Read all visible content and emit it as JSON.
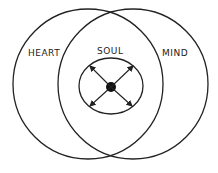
{
  "diagram": {
    "labels": {
      "left": "HEART",
      "center": "SOUL",
      "right": "MIND"
    },
    "colors": {
      "stroke": "#222222",
      "background": "#ffffff"
    },
    "elements": {
      "left_circle": "heart-circle",
      "right_circle": "mind-circle",
      "inner_circle": "soul-circle",
      "center_dot": "center-dot",
      "arrows": [
        "arrow-up-left",
        "arrow-up-right",
        "arrow-down-left",
        "arrow-down-right"
      ]
    }
  }
}
